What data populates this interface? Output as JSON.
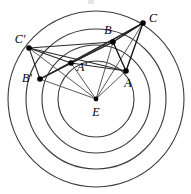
{
  "figure": {
    "width": 191,
    "height": 194,
    "background_color": "#ffffff",
    "stroke_color_circle": "#3b3b3b",
    "stroke_color_segment": "#111111",
    "stroke_color_ray": "#5a5a5a",
    "center_label": "E"
  },
  "geometry": {
    "center": {
      "name": "E",
      "x": 96,
      "y": 99,
      "label": "E",
      "label_x": 96,
      "label_y": 113
    },
    "circles": [
      {
        "name": "circle-inner",
        "cx": 96,
        "cy": 99,
        "r": 38
      },
      {
        "name": "circle-second",
        "cx": 96,
        "cy": 99,
        "r": 54
      },
      {
        "name": "circle-third",
        "cx": 96,
        "cy": 99,
        "r": 70
      },
      {
        "name": "circle-outer",
        "cx": 96,
        "cy": 99,
        "r": 88
      }
    ],
    "points": [
      {
        "name": "A",
        "label": "A",
        "x": 126,
        "y": 71,
        "label_x": 128,
        "label_y": 84
      },
      {
        "name": "B",
        "label": "B",
        "x": 113,
        "y": 42,
        "label_x": 108,
        "label_y": 31
      },
      {
        "name": "C",
        "label": "C",
        "x": 143,
        "y": 23,
        "label_x": 153,
        "label_y": 19
      },
      {
        "name": "A-prime",
        "label": "A′",
        "x": 71,
        "y": 63,
        "label_x": 82,
        "label_y": 68
      },
      {
        "name": "B-prime",
        "label": "B′",
        "x": 40,
        "y": 79,
        "label_x": 27,
        "label_y": 79
      },
      {
        "name": "C-prime",
        "label": "C′",
        "x": 29,
        "y": 48,
        "label_x": 20,
        "label_y": 40
      }
    ],
    "triangle_abc": [
      "A",
      "B",
      "C"
    ],
    "triangle_abc_prime": [
      "A-prime",
      "B-prime",
      "C-prime"
    ],
    "rays_from_center": [
      "A",
      "B",
      "C",
      "A-prime",
      "B-prime",
      "C-prime"
    ],
    "cross_segments": [
      [
        "C-prime",
        "A-prime"
      ],
      [
        "C-prime",
        "B-prime"
      ],
      [
        "B-prime",
        "A-prime"
      ],
      [
        "C-prime",
        "B"
      ],
      [
        "C-prime",
        "A"
      ],
      [
        "B-prime",
        "B"
      ],
      [
        "B-prime",
        "C"
      ],
      [
        "A-prime",
        "B"
      ],
      [
        "A-prime",
        "C"
      ],
      [
        "A-prime",
        "A"
      ]
    ],
    "triangle_edges_abc": [
      [
        "A",
        "B"
      ],
      [
        "B",
        "C"
      ],
      [
        "C",
        "A"
      ]
    ]
  }
}
